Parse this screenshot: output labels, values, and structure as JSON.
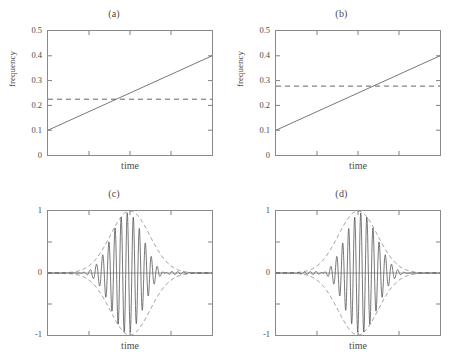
{
  "figure": {
    "background": "#ffffff",
    "axis_color": "#8a8a8a",
    "curve_color": "#555555",
    "panel_count": 4
  },
  "chart_data": [
    {
      "type": "line",
      "title": "(a)",
      "xlabel": "time",
      "ylabel": "frequency",
      "xlim": [
        0,
        1
      ],
      "ylim": [
        0,
        0.5
      ],
      "yticks": [
        0,
        0.1,
        0.2,
        0.3,
        0.4,
        0.5
      ],
      "ytick_labels": [
        "0",
        "0.1",
        "0.2",
        "0.3",
        "0.4",
        "0.5"
      ],
      "xticks": [
        0,
        0.25,
        0.5,
        0.75,
        1
      ],
      "xtick_labels": [
        "",
        "",
        "",
        "",
        ""
      ],
      "grid": false,
      "legend": "none",
      "series": [
        {
          "name": "instantaneous frequency",
          "style": "solid",
          "x": [
            0,
            1
          ],
          "values": [
            0.1,
            0.4
          ]
        },
        {
          "name": "reference frequency",
          "style": "dashed",
          "x": [
            0,
            1
          ],
          "values": [
            0.225,
            0.225
          ]
        }
      ]
    },
    {
      "type": "line",
      "title": "(b)",
      "xlabel": "time",
      "ylabel": "frequency",
      "xlim": [
        0,
        1
      ],
      "ylim": [
        0,
        0.5
      ],
      "yticks": [
        0,
        0.1,
        0.2,
        0.3,
        0.4,
        0.5
      ],
      "ytick_labels": [
        "0",
        "0.1",
        "0.2",
        "0.3",
        "0.4",
        "0.5"
      ],
      "xticks": [
        0,
        0.25,
        0.5,
        0.75,
        1
      ],
      "xtick_labels": [
        "",
        "",
        "",
        "",
        ""
      ],
      "grid": false,
      "legend": "none",
      "series": [
        {
          "name": "instantaneous frequency",
          "style": "solid",
          "x": [
            0,
            1
          ],
          "values": [
            0.1,
            0.4
          ]
        },
        {
          "name": "reference frequency",
          "style": "dashed",
          "x": [
            0,
            1
          ],
          "values": [
            0.278,
            0.278
          ]
        }
      ]
    },
    {
      "type": "line",
      "title": "(c)",
      "xlabel": "time",
      "ylabel": "",
      "xlim": [
        0,
        1
      ],
      "ylim": [
        -1,
        1
      ],
      "yticks": [
        -1,
        0,
        1
      ],
      "ytick_labels": [
        "-1",
        "0",
        "1"
      ],
      "xticks": [
        0,
        0.25,
        0.5,
        0.75,
        1
      ],
      "xtick_labels": [
        "",
        "",
        "",
        "",
        ""
      ],
      "grid": false,
      "legend": "none",
      "signal": {
        "description": "amplitude-modulated chirp, gaussian envelope, beat frequency minimum left of centre",
        "envelope_type": "gaussian",
        "envelope_center": 0.5,
        "envelope_sigma": 0.17,
        "envelope_peak": 1,
        "beat_minimum_position": 0.45,
        "frequency_start_cycles": 26,
        "frequency_end_cycles": 30,
        "samples": 900
      },
      "series": [
        {
          "name": "modulated signal",
          "style": "solid"
        },
        {
          "name": "envelope",
          "style": "dashed"
        }
      ]
    },
    {
      "type": "line",
      "title": "(d)",
      "xlabel": "time",
      "ylabel": "",
      "xlim": [
        0,
        1
      ],
      "ylim": [
        -1,
        1
      ],
      "yticks": [
        -1,
        0,
        1
      ],
      "ytick_labels": [
        "-1",
        "0",
        "1"
      ],
      "xticks": [
        0,
        0.25,
        0.5,
        0.75,
        1
      ],
      "xtick_labels": [
        "",
        "",
        "",
        "",
        ""
      ],
      "grid": false,
      "legend": "none",
      "signal": {
        "description": "mirrored amplitude-modulated chirp, gaussian envelope, beat frequency minimum right of centre",
        "envelope_type": "gaussian",
        "envelope_center": 0.5,
        "envelope_sigma": 0.17,
        "envelope_peak": 1,
        "beat_minimum_position": 0.55,
        "frequency_start_cycles": 30,
        "frequency_end_cycles": 26,
        "samples": 900
      },
      "series": [
        {
          "name": "modulated signal",
          "style": "solid"
        },
        {
          "name": "envelope",
          "style": "dashed"
        }
      ]
    }
  ]
}
